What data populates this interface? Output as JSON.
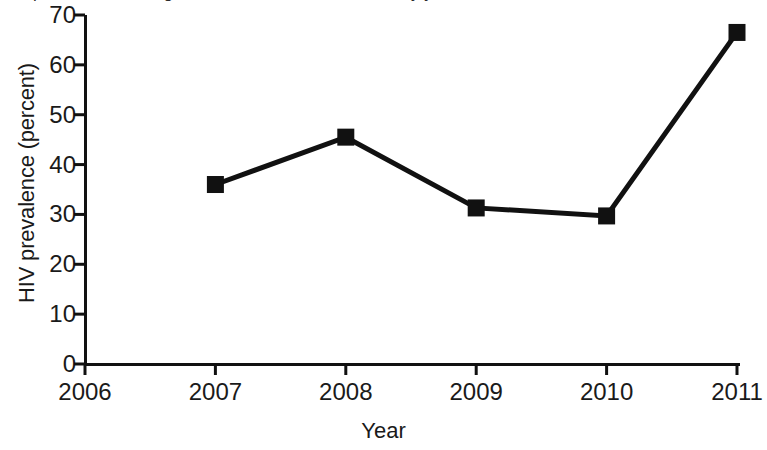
{
  "caption": {
    "text": "HIV prevalence among men who have sex with men, by year"
  },
  "chart_data": {
    "type": "line",
    "title": "",
    "xlabel": "Year",
    "ylabel": "HIV prevalence (percent)",
    "x": [
      2007,
      2008,
      2009,
      2010,
      2011
    ],
    "values": [
      36.0,
      45.5,
      31.3,
      29.7,
      66.5
    ],
    "series": [
      {
        "name": "HIV prevalence (percent)",
        "x": [
          2007,
          2008,
          2009,
          2010,
          2011
        ],
        "values": [
          36.0,
          45.5,
          31.3,
          29.7,
          66.5
        ]
      }
    ],
    "xlim": [
      2006,
      2011
    ],
    "ylim": [
      0,
      70
    ],
    "xticks": [
      2006,
      2007,
      2008,
      2009,
      2010,
      2011
    ],
    "xtick_labels": [
      "2006",
      "2007",
      "2008",
      "2009",
      "2010",
      "2011"
    ],
    "yticks": [
      0,
      10,
      20,
      30,
      40,
      50,
      60,
      70
    ],
    "ytick_labels": [
      "0",
      "10",
      "20",
      "30",
      "40",
      "50",
      "60",
      "70"
    ],
    "grid": false,
    "legend": "none",
    "marker": "square",
    "line_color": "#111111",
    "marker_color": "#111111",
    "axis_color": "#111111",
    "background": "#ffffff"
  }
}
